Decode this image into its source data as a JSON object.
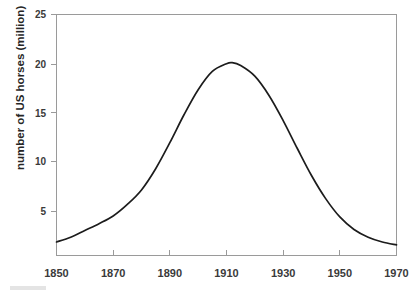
{
  "chart_data": {
    "type": "line",
    "title": "",
    "xlabel": "",
    "ylabel": "number of US horses (million)",
    "xlim": [
      1850,
      1970
    ],
    "ylim": [
      0,
      25
    ],
    "xticks": [
      1850,
      1870,
      1890,
      1910,
      1930,
      1950,
      1970
    ],
    "yticks": [
      5,
      10,
      15,
      20,
      25
    ],
    "grid": false,
    "legend": null,
    "series": [
      {
        "name": "number of US horses (million)",
        "x": [
          1850,
          1855,
          1860,
          1865,
          1870,
          1875,
          1880,
          1885,
          1890,
          1895,
          1900,
          1905,
          1910,
          1912,
          1915,
          1920,
          1925,
          1930,
          1935,
          1940,
          1945,
          1950,
          1955,
          1960,
          1965,
          1970
        ],
        "values": [
          1.4,
          1.9,
          2.6,
          3.3,
          4.1,
          5.3,
          6.8,
          9.0,
          11.7,
          14.6,
          17.2,
          19.1,
          19.9,
          20.0,
          19.7,
          18.6,
          16.6,
          14.0,
          11.1,
          8.3,
          5.9,
          4.0,
          2.7,
          1.9,
          1.4,
          1.1
        ]
      }
    ],
    "peak": {
      "x": 1912,
      "y": 20.0
    },
    "line_color": "#1c1c1c",
    "axis_color": "#9a9a9a",
    "text_color": "#3a3a3a",
    "background": "#ffffff"
  },
  "axes": {
    "y_title": "number of US horses (million)",
    "y_tick_labels": [
      "25",
      "20",
      "15",
      "10",
      "5"
    ],
    "x_tick_labels": [
      "1850",
      "1870",
      "1890",
      "1910",
      "1930",
      "1950",
      "1970"
    ]
  }
}
